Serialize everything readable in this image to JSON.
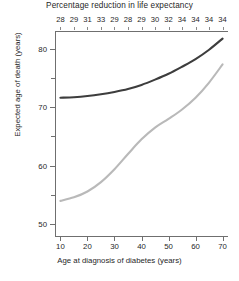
{
  "chart_data": {
    "type": "line",
    "title": "Percentage reduction in life expectancy",
    "xlabel": "Age at diagnosis of diabetes (years)",
    "ylabel": "Expected age of death (years)",
    "xlim": [
      8,
      72
    ],
    "ylim": [
      48,
      83
    ],
    "grid": false,
    "legend": "none",
    "x_ticks": [
      10,
      20,
      30,
      40,
      50,
      60,
      70
    ],
    "y_ticks": [
      50,
      60,
      70,
      80
    ],
    "y_minor_ticks": [
      55,
      65,
      75
    ],
    "top_axis": {
      "label": "Percentage reduction in life expectancy",
      "x": [
        10,
        15,
        20,
        25,
        30,
        35,
        40,
        45,
        50,
        55,
        60,
        65,
        70
      ],
      "values": [
        28,
        29,
        31,
        33,
        29,
        28,
        29,
        30,
        32,
        34,
        34,
        34,
        34
      ]
    },
    "x": [
      10,
      15,
      20,
      25,
      30,
      35,
      40,
      45,
      50,
      55,
      60,
      65,
      70
    ],
    "series": [
      {
        "name": "no-diabetes",
        "color": "#3d3d3d",
        "values": [
          71.6,
          71.7,
          71.9,
          72.2,
          72.6,
          73.1,
          73.8,
          74.7,
          75.7,
          76.9,
          78.2,
          79.8,
          81.7
        ]
      },
      {
        "name": "diabetes",
        "color": "#b9b9b9",
        "values": [
          54.0,
          54.6,
          55.6,
          57.2,
          59.4,
          62.0,
          64.5,
          66.5,
          68.0,
          69.6,
          71.6,
          74.2,
          77.3
        ]
      }
    ]
  }
}
